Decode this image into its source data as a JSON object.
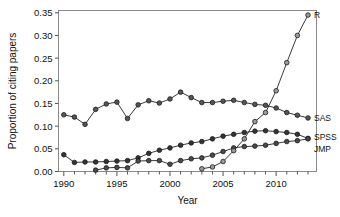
{
  "chart_data": {
    "type": "line",
    "title": "",
    "xlabel": "Year",
    "ylabel": "Proportion of citing papers",
    "xlim": [
      1989.5,
      2013.8
    ],
    "ylim": [
      0.0,
      0.355
    ],
    "grid": false,
    "legend_position": "right-inline-labels",
    "x_ticks_major": [
      1990,
      1995,
      2000,
      2005,
      2010
    ],
    "x_tick_labels": [
      "1990",
      "1995",
      "2000",
      "2005",
      "2010"
    ],
    "x_ticks_all": [
      1990,
      1991,
      1992,
      1993,
      1994,
      1995,
      1996,
      1997,
      1998,
      1999,
      2000,
      2001,
      2002,
      2003,
      2004,
      2005,
      2006,
      2007,
      2008,
      2009,
      2010,
      2011,
      2012,
      2013
    ],
    "y_ticks": [
      0.0,
      0.05,
      0.1,
      0.15,
      0.2,
      0.25,
      0.3,
      0.35
    ],
    "y_tick_labels": [
      "0.00",
      "0.05",
      "0.10",
      "0.15",
      "0.20",
      "0.25",
      "0.30",
      "0.35"
    ],
    "marker": "circle",
    "series": [
      {
        "name": "SAS",
        "label": "SAS",
        "marker_fill": "#555555",
        "line_color": "#222222",
        "x": [
          1990,
          1991,
          1992,
          1993,
          1994,
          1995,
          1996,
          1997,
          1998,
          1999,
          2000,
          2001,
          2002,
          2003,
          2004,
          2005,
          2006,
          2007,
          2008,
          2009,
          2010,
          2011,
          2012,
          2013
        ],
        "values": [
          0.125,
          0.12,
          0.104,
          0.137,
          0.149,
          0.153,
          0.117,
          0.147,
          0.156,
          0.151,
          0.16,
          0.175,
          0.163,
          0.152,
          0.152,
          0.155,
          0.157,
          0.152,
          0.148,
          0.146,
          0.14,
          0.13,
          0.124,
          0.118
        ]
      },
      {
        "name": "SPSS",
        "label": "SPSS",
        "marker_fill": "#333333",
        "line_color": "#222222",
        "x": [
          1990,
          1991,
          1992,
          1993,
          1994,
          1995,
          1996,
          1997,
          1998,
          1999,
          2000,
          2001,
          2002,
          2003,
          2004,
          2005,
          2006,
          2007,
          2008,
          2009,
          2010,
          2011,
          2012,
          2013
        ],
        "values": [
          0.037,
          0.02,
          0.021,
          0.021,
          0.022,
          0.023,
          0.024,
          0.03,
          0.04,
          0.047,
          0.052,
          0.058,
          0.063,
          0.066,
          0.072,
          0.078,
          0.082,
          0.086,
          0.089,
          0.09,
          0.088,
          0.086,
          0.082,
          0.073
        ]
      },
      {
        "name": "JMP",
        "label": "JMP",
        "marker_fill": "#4a4a4a",
        "line_color": "#222222",
        "x": [
          1993,
          1994,
          1995,
          1996,
          1997,
          1998,
          1999,
          2000,
          2001,
          2002,
          2003,
          2004,
          2005,
          2006,
          2007,
          2008,
          2009,
          2010,
          2011,
          2012,
          2013
        ],
        "values": [
          0.003,
          0.008,
          0.009,
          0.008,
          0.023,
          0.024,
          0.024,
          0.016,
          0.024,
          0.028,
          0.03,
          0.036,
          0.044,
          0.052,
          0.055,
          0.056,
          0.058,
          0.062,
          0.066,
          0.068,
          0.072
        ]
      },
      {
        "name": "R",
        "label": "R",
        "marker_fill": "#9a9a9a",
        "line_color": "#222222",
        "x": [
          2003,
          2004,
          2005,
          2006,
          2007,
          2008,
          2009,
          2010,
          2011,
          2012,
          2013
        ],
        "values": [
          0.006,
          0.01,
          0.022,
          0.046,
          0.072,
          0.11,
          0.13,
          0.178,
          0.24,
          0.3,
          0.345
        ]
      }
    ]
  },
  "axes": {
    "y_title": "Proportion of citing papers",
    "x_title": "Year"
  }
}
